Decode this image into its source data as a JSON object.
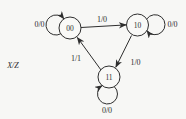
{
  "diagram": {
    "legend": "X/Z",
    "states": [
      {
        "label": "00"
      },
      {
        "label": "10"
      },
      {
        "label": "11"
      }
    ],
    "labels": {
      "loop00": "0/0",
      "t0010": "1/0",
      "loop10": "0/0",
      "t1011": "1/0",
      "t1100": "1/1",
      "loop11": "0/0"
    },
    "colors": {
      "ink": "#2e2e2e",
      "background": "#f7f7f5"
    }
  }
}
